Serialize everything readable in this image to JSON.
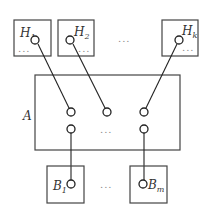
{
  "diagram": {
    "top_modules": [
      {
        "label": "H",
        "subscript": "1",
        "dots": "...",
        "box": [
          14,
          20,
          37,
          36
        ],
        "port": [
          35,
          40
        ]
      },
      {
        "label": "H",
        "subscript": "2",
        "dots": "...",
        "box": [
          58,
          20,
          36,
          36
        ],
        "port": [
          70,
          40
        ]
      },
      {
        "label": "H",
        "subscript": "k",
        "dots": "...",
        "box": [
          162,
          20,
          36,
          36
        ],
        "port": [
          179,
          40
        ]
      }
    ],
    "top_ellipsis": "...",
    "center_module": {
      "label": "A",
      "box": [
        35,
        75,
        145,
        75
      ],
      "middle_dots": "..."
    },
    "center_top_ports": [
      [
        71,
        112
      ],
      [
        107,
        112
      ],
      [
        144,
        112
      ]
    ],
    "center_bottom_ports": [
      [
        71,
        129
      ],
      [
        144,
        129
      ]
    ],
    "bottom_modules": [
      {
        "label": "B",
        "subscript": "1",
        "box": [
          47,
          166,
          37,
          37
        ],
        "port": [
          71,
          184
        ]
      },
      {
        "label": "B",
        "subscript": "m",
        "box": [
          130,
          166,
          37,
          37
        ],
        "port": [
          143,
          184
        ]
      }
    ],
    "bottom_ellipsis": "...",
    "colors": {
      "line": "#222222",
      "box": "#444444",
      "text": "#333333",
      "dots": "#888888"
    }
  }
}
